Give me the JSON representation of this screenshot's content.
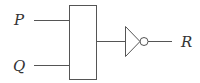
{
  "diagram": {
    "type": "logic-circuit",
    "inputs": [
      {
        "label": "P"
      },
      {
        "label": "Q"
      }
    ],
    "gates": [
      {
        "name": "block",
        "description": "rectangular gate with two inputs"
      },
      {
        "name": "not-gate",
        "description": "inverter (triangle with bubble)"
      }
    ],
    "output": {
      "label": "R"
    },
    "colors": {
      "stroke": "#555555",
      "text": "#333333",
      "background": "#ffffff"
    }
  }
}
